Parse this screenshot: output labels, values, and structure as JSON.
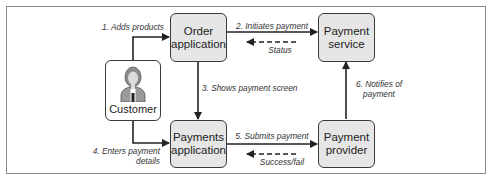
{
  "diagram": {
    "nodes": [
      {
        "id": "customer",
        "label": "Customer"
      },
      {
        "id": "order_app",
        "label": "Order\napplication"
      },
      {
        "id": "payment_service",
        "label": "Payment\nservice"
      },
      {
        "id": "payments_app",
        "label": "Payments\napplication"
      },
      {
        "id": "payment_provider",
        "label": "Payment\nprovider"
      }
    ],
    "edges": [
      {
        "from": "customer",
        "to": "order_app",
        "label": "1. Adds products",
        "style": "solid"
      },
      {
        "from": "order_app",
        "to": "payment_service",
        "label": "2. Initiates payment",
        "style": "solid"
      },
      {
        "from": "payment_service",
        "to": "order_app",
        "label": "Status",
        "style": "dashed"
      },
      {
        "from": "order_app",
        "to": "payments_app",
        "label": "3. Shows payment screen",
        "style": "solid"
      },
      {
        "from": "customer",
        "to": "payments_app",
        "label": "4. Enters payment\ndetails",
        "style": "solid"
      },
      {
        "from": "payments_app",
        "to": "payment_provider",
        "label": "5. Submits payment",
        "style": "solid"
      },
      {
        "from": "payment_provider",
        "to": "payments_app",
        "label": "Success/fail",
        "style": "dashed"
      },
      {
        "from": "payment_provider",
        "to": "payment_service",
        "label": "6. Notifies of\npayment",
        "style": "solid"
      }
    ],
    "colors": {
      "box_fill": "#e6e6e6",
      "stroke": "#222222",
      "frame": "#8a8a8a"
    }
  }
}
